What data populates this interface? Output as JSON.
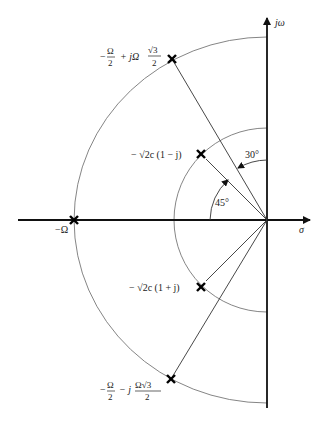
{
  "diagram": {
    "type": "s-plane pole plot",
    "axes": {
      "horizontal_label": "σ",
      "vertical_label": "jω"
    },
    "poles": [
      {
        "id": "pole-top-outer",
        "label_main": "−",
        "label_frac1_num": "Ω",
        "label_frac1_den": "2",
        "label_mid": "+ jΩ",
        "label_frac2_num": "√3",
        "label_frac2_den": "2"
      },
      {
        "id": "pole-real",
        "label": "−Ω"
      },
      {
        "id": "pole-bottom-outer",
        "label_main": "−",
        "label_frac1_num": "Ω",
        "label_frac1_den": "2",
        "label_mid": "− j",
        "label_frac2_num": "Ω√3",
        "label_frac2_den": "2"
      },
      {
        "id": "pole-top-inner",
        "label": "− √2c (1 − j)"
      },
      {
        "id": "pole-bottom-inner",
        "label": "− √2c (1 + j)"
      }
    ],
    "angles": {
      "angle_30": "30°",
      "angle_45": "45°"
    },
    "colors": {
      "axis": "#111111",
      "arc": "#777777",
      "ray": "#333333",
      "pole": "#000000"
    }
  }
}
